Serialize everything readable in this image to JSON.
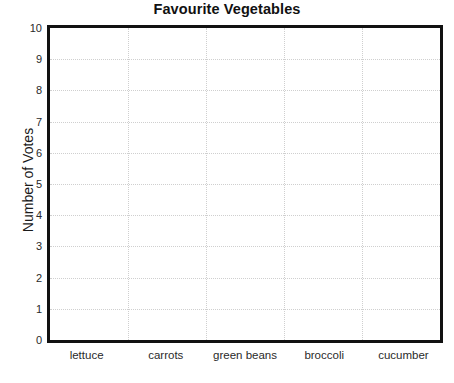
{
  "chart_data": {
    "type": "bar",
    "title": "Favourite Vegetables",
    "xlabel": "",
    "ylabel": "Number of Votes",
    "categories": [
      "lettuce",
      "carrots",
      "green beans",
      "broccoli",
      "cucumber"
    ],
    "values": [
      0,
      0,
      0,
      0,
      0
    ],
    "ylim": [
      0,
      10
    ],
    "ytick_step": 1,
    "yticks": [
      10,
      9,
      8,
      7,
      6,
      5,
      4,
      3,
      2,
      1,
      0
    ],
    "grid": {
      "horizontal": true,
      "vertical": true,
      "style": "dotted",
      "color": "#cfcfcf"
    },
    "legend": null,
    "annotations": [],
    "note": "Blank tally/graph template - no bars drawn, plot area is empty",
    "colors": {
      "background": "#ffffff",
      "plot_background": "#ffffff",
      "axis_frame": "#111111",
      "text": "#1a1a1a"
    }
  }
}
